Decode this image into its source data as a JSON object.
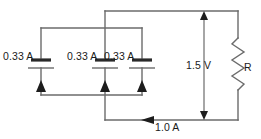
{
  "diagram": {
    "type": "electrical-circuit-schematic",
    "background_color": "#ffffff",
    "wire_color": "#6b6b6b",
    "label_color": "#1a1a1a"
  },
  "labels": {
    "cell_1_current": "0.33 A",
    "cell_2_current": "0.33 A",
    "cell_3_current": "0.33 A",
    "source_voltage": "1.5 V",
    "resistor": "R",
    "total_current": "1.0 A"
  },
  "components": [
    {
      "name": "battery-cell-1",
      "kind": "battery",
      "current_label": "0.33 A",
      "x": 41,
      "y": 65
    },
    {
      "name": "battery-cell-2",
      "kind": "battery",
      "current_label": "0.33 A",
      "x": 105,
      "y": 65
    },
    {
      "name": "battery-cell-3",
      "kind": "battery",
      "current_label": "0.33 A",
      "x": 142,
      "y": 65
    },
    {
      "name": "resistor",
      "kind": "resistor",
      "label": "R",
      "x": 238,
      "y": 67
    }
  ],
  "annotations": [
    {
      "name": "voltage-dimension",
      "kind": "double-headed-arrow",
      "orientation": "vertical",
      "label": "1.5 V"
    },
    {
      "name": "current-direction-arrow",
      "kind": "single-headed-arrow",
      "orientation": "horizontal-left",
      "label": "1.0 A"
    }
  ]
}
